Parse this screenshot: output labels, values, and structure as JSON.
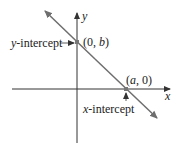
{
  "diagram": {
    "axes": {
      "x_label": "x",
      "y_label": "y"
    },
    "points": {
      "y_intercept_point": {
        "label_open": "(0, ",
        "label_var": "b",
        "label_close": ")"
      },
      "x_intercept_point": {
        "label_open": "(",
        "label_var": "a",
        "label_close": ", 0)"
      }
    },
    "annotations": {
      "y_intercept": {
        "var": "y",
        "text": "-intercept"
      },
      "x_intercept": {
        "var": "x",
        "text": "-intercept"
      }
    },
    "colors": {
      "line": "#6e6e6e",
      "axis": "#333333",
      "point": "#777777"
    }
  }
}
